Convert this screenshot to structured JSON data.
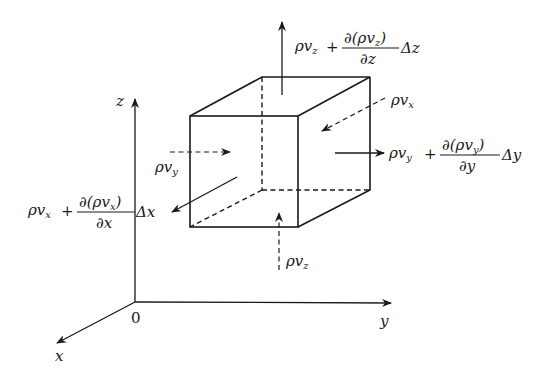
{
  "diagram": {
    "axes": {
      "x_label": "x",
      "y_label": "y",
      "z_label": "z",
      "origin_label": "0"
    },
    "fluxes": {
      "z_in": {
        "rho": "ρ",
        "v": "v",
        "sub": "z"
      },
      "z_out": {
        "rho": "ρ",
        "v": "v",
        "sub": "z",
        "plus": "+",
        "num": "∂(ρv",
        "num_sub": "z",
        "num_close": ")",
        "den": "∂z",
        "delta": "Δz"
      },
      "x_in": {
        "rho": "ρ",
        "v": "v",
        "sub": "x"
      },
      "x_out": {
        "rho": "ρ",
        "v": "v",
        "sub": "x",
        "plus": "+",
        "num": "∂(ρv",
        "num_sub": "x",
        "num_close": ")",
        "den": "∂x",
        "delta": "Δx"
      },
      "y_in": {
        "rho": "ρ",
        "v": "v",
        "sub": "y"
      },
      "y_out": {
        "rho": "ρ",
        "v": "v",
        "sub": "y",
        "plus": "+",
        "num": "∂(ρv",
        "num_sub": "y",
        "num_close": ")",
        "den": "∂y",
        "delta": "Δy"
      }
    },
    "colors": {
      "ink": "#1a1a1a",
      "background": "#ffffff"
    }
  }
}
